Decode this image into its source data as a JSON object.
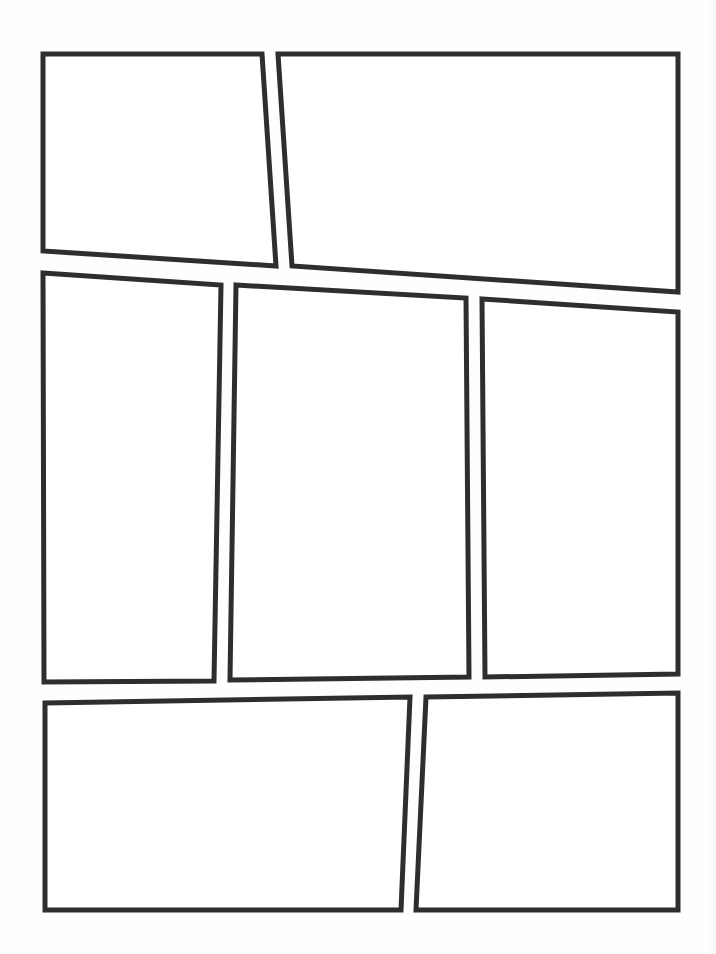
{
  "page": {
    "type": "comic-page-template",
    "background": "#ffffff",
    "border_color": "#2e2e2e",
    "panel_count": 7
  },
  "panels": [
    {
      "id": 1,
      "points": "43,54 262,54 276,266 43,251"
    },
    {
      "id": 2,
      "points": "278,54 678,54 678,292 292,266"
    },
    {
      "id": 3,
      "points": "43,273 221,285 214,681 44,682"
    },
    {
      "id": 4,
      "points": "236,285 466,298 469,677 230,680"
    },
    {
      "id": 5,
      "points": "482,299 678,312 678,674 485,677"
    },
    {
      "id": 6,
      "points": "45,703 410,697 401,910 45,910"
    },
    {
      "id": 7,
      "points": "426,697 678,693 678,910 416,910"
    }
  ]
}
